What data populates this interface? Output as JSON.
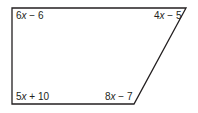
{
  "diagram": {
    "type": "quadrilateral",
    "shape": "right trapezoid",
    "stroke_color": "#231f20",
    "vertices": {
      "top_left": [
        12,
        8
      ],
      "top_right": [
        186,
        8
      ],
      "bottom_right": [
        134,
        104
      ],
      "bottom_left": [
        12,
        104
      ]
    },
    "angles": {
      "top_left": {
        "coef": "6",
        "var": "x",
        "rest": " − 6"
      },
      "top_right": {
        "coef": "4",
        "var": "x",
        "rest": " − 5"
      },
      "bottom_left": {
        "coef": "5",
        "var": "x",
        "rest": " + 10"
      },
      "bottom_right": {
        "coef": "8",
        "var": "x",
        "rest": " − 7"
      }
    }
  }
}
